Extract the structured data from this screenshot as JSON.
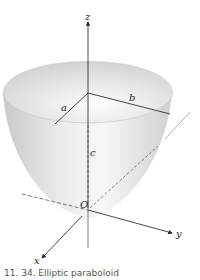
{
  "diagram": {
    "subject": "elliptic paraboloid",
    "axes": {
      "x_label": "x",
      "y_label": "y",
      "z_label": "z",
      "origin_label": "O"
    },
    "dimension_labels": {
      "a": "a",
      "b": "b",
      "c": "c"
    },
    "colors": {
      "surface_light": "#f4f4f4",
      "surface_dark": "#b8b8b8",
      "line": "#333333"
    }
  },
  "caption": "11. 34.  Elliptic paraboloid"
}
